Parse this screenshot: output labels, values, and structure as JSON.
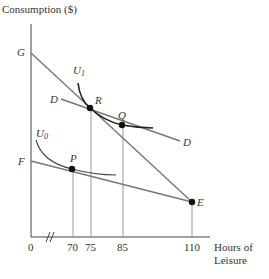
{
  "axes": {
    "y_label": "Consumption ($)",
    "x_label_line1": "Hours of",
    "x_label_line2": "Leisure",
    "origin": "0",
    "x_ticks": [
      "70",
      "75",
      "85",
      "110"
    ]
  },
  "labels": {
    "G": "G",
    "F": "F",
    "D_left": "D",
    "D_right": "D",
    "U1": "U",
    "U1_sub": "1",
    "U0": "U",
    "U0_sub": "0",
    "R": "R",
    "Q": "Q",
    "P": "P",
    "E": "E"
  },
  "colors": {
    "line": "#777777",
    "curve": "#222222",
    "dot": "#111111",
    "axis": "#444444"
  }
}
